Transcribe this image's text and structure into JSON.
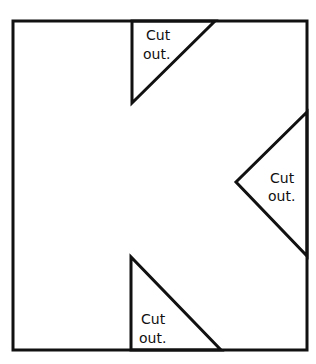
{
  "diagram": {
    "stroke_color": "#111111",
    "background": "#ffffff",
    "labels": {
      "top": [
        "Cut",
        "out."
      ],
      "right": [
        "Cut",
        "out."
      ],
      "bottom": [
        "Cut",
        "out."
      ]
    }
  }
}
